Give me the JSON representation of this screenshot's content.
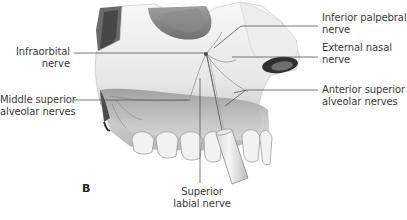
{
  "figure": {
    "panel_letter": "B",
    "labels": {
      "infraorbital": {
        "line1": "Infraorbital",
        "line2": "nerve"
      },
      "middle_superior_alveolar": {
        "line1": "Middle superior",
        "line2": "alveolar nerves"
      },
      "inferior_palpebral": {
        "line1": "Inferior palpebral",
        "line2": "nerve"
      },
      "external_nasal": {
        "line1": "External nasal",
        "line2": "nerve"
      },
      "anterior_superior_alveolar": {
        "line1": "Anterior superior",
        "line2": "alveolar nerves"
      },
      "superior_labial": {
        "line1": "Superior",
        "line2": "labial nerve"
      }
    },
    "colors": {
      "leader_line": "#555555",
      "text": "#3a3a3a",
      "bone_light": "#f2f2f2",
      "bone_mid": "#cfcfcf",
      "shadow_dark": "#5a5a5a"
    }
  }
}
